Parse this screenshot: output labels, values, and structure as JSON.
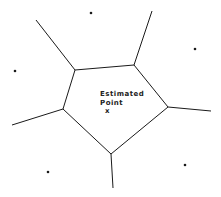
{
  "diagram": {
    "type": "voronoi",
    "label_line1": "Estimated",
    "label_line2": "Point",
    "marker": "x",
    "line_color": "#1a1a1a",
    "cell_vertices": [
      [
        75,
        70
      ],
      [
        134,
        65
      ],
      [
        168,
        107
      ],
      [
        111,
        154
      ],
      [
        63,
        109
      ]
    ],
    "rays": [
      [
        [
          75,
          70
        ],
        [
          36,
          20
        ]
      ],
      [
        [
          134,
          65
        ],
        [
          152,
          11
        ]
      ],
      [
        [
          168,
          107
        ],
        [
          211,
          111
        ]
      ],
      [
        [
          111,
          154
        ],
        [
          113,
          188
        ]
      ],
      [
        [
          63,
          109
        ],
        [
          12,
          125
        ]
      ]
    ],
    "sites": [
      [
        91,
        13
      ],
      [
        195,
        49
      ],
      [
        15,
        71
      ],
      [
        48,
        172
      ],
      [
        185,
        165
      ]
    ],
    "estimated_point": [
      108,
      110
    ]
  }
}
